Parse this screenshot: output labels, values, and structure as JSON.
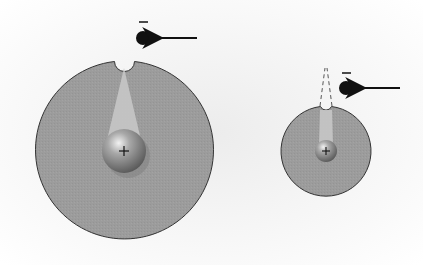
{
  "diagram": {
    "type": "atomic-size-comparison",
    "colors": {
      "background": "#f4f4f4",
      "electron_cloud": "#9a9a9a",
      "cloud_outline": "#333333",
      "cone": "#c4c4c4",
      "electron": "#111111",
      "arrow": "#111111"
    },
    "atoms": [
      {
        "name": "large-atom",
        "center": [
          124,
          151
        ],
        "radius": 89,
        "nucleus_radius": 22,
        "nucleus_label": "+",
        "electron": {
          "center": [
            143,
            38
          ],
          "radius": 7,
          "charge_label": "−"
        }
      },
      {
        "name": "small-atom",
        "center": [
          326,
          151
        ],
        "radius": 45,
        "nucleus_radius": 11,
        "nucleus_label": "+",
        "electron": {
          "center": [
            346,
            88
          ],
          "radius": 7,
          "charge_label": "−"
        }
      }
    ]
  }
}
